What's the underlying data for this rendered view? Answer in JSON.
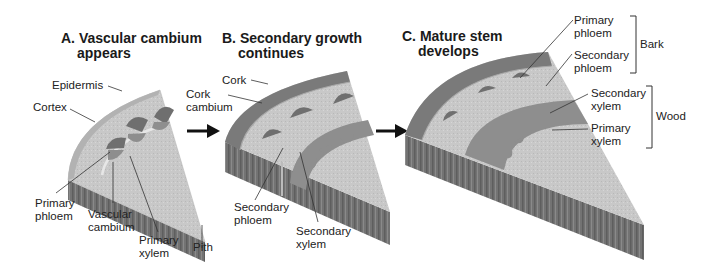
{
  "panels": [
    {
      "id": "A",
      "title_letter": "A.",
      "title_line1": "Vascular cambium",
      "title_line2": "appears",
      "labels": {
        "epidermis": "Epidermis",
        "cortex": "Cortex",
        "primary_phloem_1": "Primary",
        "primary_phloem_2": "phloem",
        "vascular_cambium_1": "Vascular",
        "vascular_cambium_2": "cambium",
        "primary_xylem_1": "Primary",
        "primary_xylem_2": "xylem",
        "pith": "Pith"
      }
    },
    {
      "id": "B",
      "title_letter": "B.",
      "title_line1": "Secondary growth",
      "title_line2": "continues",
      "labels": {
        "cork": "Cork",
        "cork_cambium_1": "Cork",
        "cork_cambium_2": "cambium",
        "secondary_phloem_1": "Secondary",
        "secondary_phloem_2": "phloem",
        "secondary_xylem_1": "Secondary",
        "secondary_xylem_2": "xylem"
      }
    },
    {
      "id": "C",
      "title_letter": "C.",
      "title_line1": "Mature stem",
      "title_line2": "develops",
      "labels": {
        "primary_phloem_1": "Primary",
        "primary_phloem_2": "phloem",
        "secondary_phloem_1": "Secondary",
        "secondary_phloem_2": "phloem",
        "secondary_xylem_1": "Secondary",
        "secondary_xylem_2": "xylem",
        "primary_xylem_1": "Primary",
        "primary_xylem_2": "xylem"
      },
      "brackets": {
        "bark": "Bark",
        "wood": "Wood"
      }
    }
  ],
  "colors": {
    "epidermis": "#b4b4b4",
    "cortex": "#c9c9c9",
    "phloem": "#6f6f6f",
    "xylem": "#8e8e8e",
    "cork": "#7a7a7a",
    "side": "#727272",
    "side_dark": "#5a5a5a",
    "line": "#333333"
  }
}
